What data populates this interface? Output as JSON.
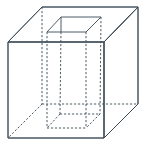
{
  "figure": {
    "title": "",
    "colors": {
      "top_face": "#eaf8fc",
      "front_face": "#b9ebf4",
      "right_face": "#8fdcf0",
      "hole_opening": "#f7f3df",
      "edge": "#3a4a55"
    },
    "cube": {
      "front_top_left": [
        8,
        42
      ],
      "front_top_right": [
        104,
        42
      ],
      "front_bottom_left": [
        8,
        138
      ],
      "front_bottom_right": [
        104,
        138
      ],
      "back_top_left": [
        42,
        7
      ],
      "back_top_right": [
        138,
        7
      ],
      "back_bottom_left": [
        42,
        104
      ],
      "back_bottom_right": [
        138,
        104
      ]
    },
    "hole_top": {
      "back_left": [
        61,
        17
      ],
      "back_right": [
        101,
        17
      ],
      "front_left": [
        47,
        32
      ],
      "front_right": [
        86,
        32
      ]
    },
    "hole_bottom": {
      "back_left": [
        60,
        114
      ],
      "back_right": [
        100,
        114
      ],
      "front_left": [
        47,
        128
      ],
      "front_right": [
        86,
        128
      ]
    }
  }
}
